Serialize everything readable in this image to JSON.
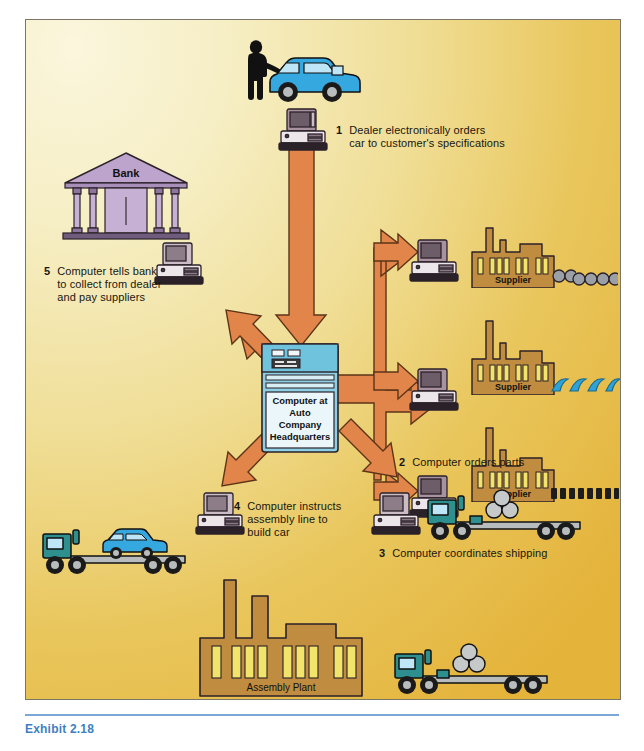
{
  "figure": {
    "caption": "Exhibit 2.18",
    "central_node": {
      "name": "computer-at-auto-company-headquarters",
      "lines": [
        "Computer at",
        "Auto",
        "Company",
        "Headquarters"
      ],
      "color": "#8ecfe3"
    },
    "bank": {
      "label": "Bank",
      "color": "#bda4cd"
    },
    "assembly_plant": {
      "label": "Assembly Plant",
      "color": "#c08c3f"
    },
    "suppliers": [
      {
        "label": "Supplier",
        "product": "wheels"
      },
      {
        "label": "Supplier",
        "product": "hoods"
      },
      {
        "label": "Supplier",
        "product": "parts"
      }
    ],
    "steps": [
      {
        "num": "1",
        "lines": [
          "Dealer electronically orders",
          "car to customer's specifications"
        ]
      },
      {
        "num": "2",
        "lines": [
          "Computer orders parts"
        ]
      },
      {
        "num": "3",
        "lines": [
          "Computer coordinates shipping"
        ]
      },
      {
        "num": "4",
        "lines": [
          "Computer instructs",
          "assembly line to",
          "build car"
        ]
      },
      {
        "num": "5",
        "lines": [
          "Computer tells bank",
          "to collect from dealer",
          "and pay suppliers"
        ]
      }
    ],
    "colors": {
      "arrow": "#e2854b",
      "arrow_outline": "#5c3418",
      "background_light": "#fbf6dd",
      "background_dark": "#e4b33a",
      "factory": "#c08c3f",
      "window": "#f2e36a",
      "car": "#35a8e0",
      "truck": "#2e8f8f",
      "computer_case": "#e9e3e6",
      "computer_shade": "#9b8a96",
      "caption_color": "#3f7fc1",
      "rule_color": "#7aa7d6"
    }
  }
}
